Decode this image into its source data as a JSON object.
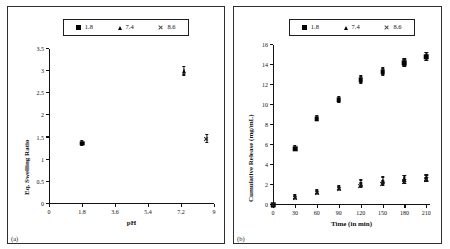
{
  "figure": {
    "panel_a_tag": "(a)",
    "panel_b_tag": "(b)"
  },
  "legend": {
    "items": [
      {
        "marker": "square",
        "label": "1.8"
      },
      {
        "marker": "triangle",
        "label": "7.4"
      },
      {
        "marker": "x",
        "label": "8.6"
      }
    ]
  },
  "chart_data": [
    {
      "type": "scatter",
      "panel": "(a)",
      "title": "",
      "xlabel": "pH",
      "ylabel": "Eq. Swelling Ratio",
      "xlim": [
        0,
        9
      ],
      "ylim": [
        0,
        3.5
      ],
      "xticks": [
        "0",
        "1.8",
        "3.6",
        "5.4",
        "7.2",
        "9"
      ],
      "xtick_values": [
        0,
        1.8,
        3.6,
        5.4,
        7.2,
        9
      ],
      "yticks": [
        "0",
        "0.5",
        "1",
        "1.5",
        "2",
        "2.5",
        "3",
        "3.5"
      ],
      "ytick_values": [
        0,
        0.5,
        1,
        1.5,
        2,
        2.5,
        3,
        3.5
      ],
      "grid": false,
      "legend_position": "top-center",
      "series": [
        {
          "name": "1.8",
          "marker": "square",
          "x": [
            1.8
          ],
          "y": [
            1.37
          ],
          "yerr": [
            0.05
          ]
        },
        {
          "name": "7.4",
          "marker": "triangle",
          "x": [
            7.35
          ],
          "y": [
            3.0
          ],
          "yerr": [
            0.1
          ]
        },
        {
          "name": "8.6",
          "marker": "x",
          "x": [
            8.6
          ],
          "y": [
            1.47
          ],
          "yerr": [
            0.09
          ]
        }
      ]
    },
    {
      "type": "scatter",
      "panel": "(b)",
      "title": "",
      "xlabel": "Time (in min)",
      "ylabel": "Cumulative Release (mg/mL)",
      "xlim": [
        0,
        215
      ],
      "ylim": [
        0,
        16
      ],
      "xticks": [
        "0",
        "30",
        "60",
        "90",
        "120",
        "150",
        "180",
        "210"
      ],
      "xtick_values": [
        0,
        30,
        60,
        90,
        120,
        150,
        180,
        210
      ],
      "yticks": [
        "0",
        "2",
        "4",
        "6",
        "8",
        "10",
        "12",
        "14",
        "16"
      ],
      "ytick_values": [
        0,
        2,
        4,
        6,
        8,
        10,
        12,
        14,
        16
      ],
      "grid": false,
      "legend_position": "top-center",
      "series": [
        {
          "name": "1.8",
          "marker": "square",
          "x": [
            0,
            30,
            60,
            90,
            120,
            150,
            180,
            210
          ],
          "y": [
            0.05,
            5.65,
            8.65,
            10.5,
            12.5,
            13.3,
            14.2,
            14.8
          ],
          "yerr": [
            0.05,
            0.25,
            0.25,
            0.3,
            0.35,
            0.35,
            0.35,
            0.4
          ]
        },
        {
          "name": "7.4",
          "marker": "triangle",
          "x": [
            0,
            30,
            60,
            90,
            120,
            150,
            180,
            210
          ],
          "y": [
            0.05,
            0.8,
            1.3,
            1.7,
            2.15,
            2.45,
            2.6,
            2.65
          ],
          "yerr": [
            0.05,
            0.2,
            0.2,
            0.2,
            0.3,
            0.3,
            0.3,
            0.3
          ]
        },
        {
          "name": "8.6",
          "marker": "x",
          "x": [
            0,
            30,
            60,
            90,
            120,
            150,
            180,
            210
          ],
          "y": [
            0.05,
            0.75,
            1.25,
            1.65,
            1.95,
            2.15,
            2.3,
            2.5
          ],
          "yerr": [
            0.05,
            0.15,
            0.15,
            0.15,
            0.2,
            0.2,
            0.2,
            0.2
          ]
        }
      ]
    }
  ]
}
